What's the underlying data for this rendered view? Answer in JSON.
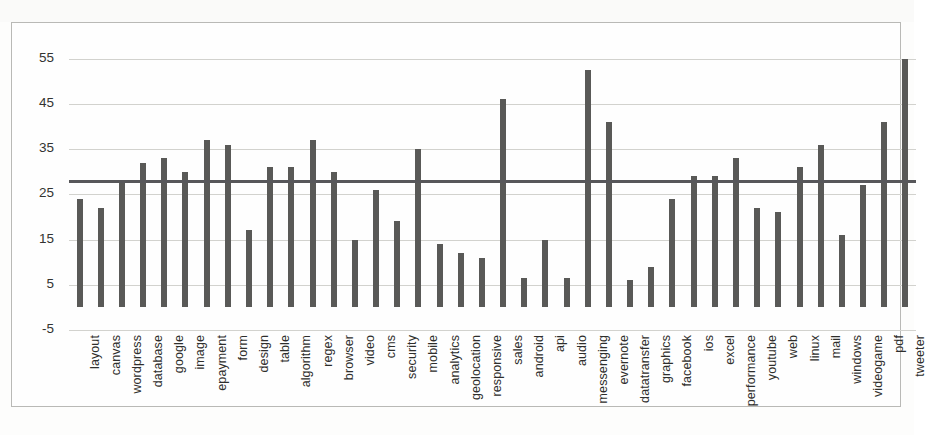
{
  "chart_data": {
    "type": "bar",
    "title": "",
    "subtitle": "",
    "xlabel": "",
    "ylabel": "",
    "ylim": [
      -5,
      58
    ],
    "yticks": [
      -5,
      5,
      15,
      25,
      35,
      45,
      55
    ],
    "grid": true,
    "legend": null,
    "bar_color": "#595957",
    "trend_line": {
      "label": "average",
      "value": 28,
      "color": "#57575a",
      "style": "solid"
    },
    "categories": [
      "layout",
      "canvas",
      "wordpress",
      "database",
      "google",
      "image",
      "epayment",
      "form",
      "design",
      "table",
      "algorithm",
      "regex",
      "browser",
      "video",
      "cms",
      "security",
      "mobile",
      "analytics",
      "geolocation",
      "responsive",
      "sales",
      "android",
      "api",
      "audio",
      "messenging",
      "evernote",
      "datatransfer",
      "graphics",
      "facebook",
      "ios",
      "excel",
      "performance",
      "youtube",
      "web",
      "linux",
      "mail",
      "windows",
      "videogame",
      "pdf",
      "tweeter"
    ],
    "values": [
      24,
      22,
      28,
      32,
      33,
      30,
      37,
      36,
      17,
      31,
      31,
      37,
      30,
      15,
      26,
      19,
      35,
      14,
      12,
      11,
      46,
      6.5,
      15,
      6.5,
      52.5,
      41,
      6,
      9,
      24,
      29,
      29,
      33,
      22,
      21,
      31,
      36,
      16,
      27,
      41,
      55
    ]
  },
  "axis": {
    "y_tick_labels": [
      "55",
      "45",
      "35",
      "25",
      "15",
      "5",
      "-5"
    ]
  }
}
